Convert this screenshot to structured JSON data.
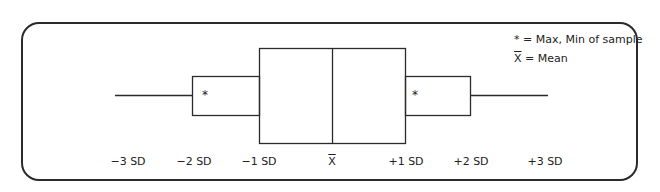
{
  "diagram": {
    "type": "box-plot-schematic",
    "legend": {
      "items": [
        {
          "symbol": "*",
          "text": "= Max, Min of sample"
        },
        {
          "symbol": "X",
          "symbol_style": "overline",
          "text": "= Mean"
        }
      ]
    },
    "axis_labels": [
      {
        "text": "−3 SD",
        "x": 128
      },
      {
        "text": "−2 SD",
        "x": 194
      },
      {
        "text": "−1 SD",
        "x": 259
      },
      {
        "text": "X",
        "x": 332,
        "style": "overline"
      },
      {
        "text": "+1 SD",
        "x": 406
      },
      {
        "text": "+2 SD",
        "x": 471
      },
      {
        "text": "+3 SD",
        "x": 545
      }
    ],
    "markers": [
      {
        "symbol": "*",
        "position": "left-inner-box"
      },
      {
        "symbol": "*",
        "position": "right-inner-box"
      }
    ],
    "line_color": "#2b2b2b"
  }
}
